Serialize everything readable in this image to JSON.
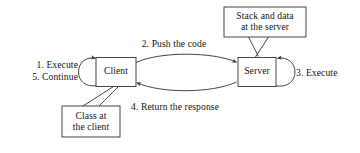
{
  "diagram": {
    "background_color": "#ffffff",
    "stroke_color": "#3b3b3b",
    "text_color": "#161616",
    "nodes": [
      {
        "id": "client",
        "label": "Client"
      },
      {
        "id": "server",
        "label": "Server"
      }
    ],
    "callouts": [
      {
        "id": "callout-server",
        "line1": "Stack and data",
        "line2": "at the server",
        "points_to": "server"
      },
      {
        "id": "callout-client",
        "line1": "Class at",
        "line2": "the client",
        "points_to": "client"
      }
    ],
    "steps": [
      {
        "number": "1.",
        "label": "1. Execute",
        "position": "left-of-client",
        "arrow": "client-self-loop"
      },
      {
        "number": "2.",
        "label": "2. Push the code",
        "position": "above-middle",
        "arrow": "client-to-server"
      },
      {
        "number": "3.",
        "label": "3. Execute",
        "position": "right-of-server",
        "arrow": "server-self-loop"
      },
      {
        "number": "4.",
        "label": "4. Return the response",
        "position": "below-middle",
        "arrow": "server-to-client"
      },
      {
        "number": "5.",
        "label": "5. Continue",
        "position": "left-of-client",
        "arrow": "client-self-loop"
      }
    ],
    "arrows": [
      {
        "id": "client-to-server",
        "from": "client",
        "to": "server",
        "shape": "curve-upper",
        "label_ref": "2. Push the code"
      },
      {
        "id": "server-to-client",
        "from": "server",
        "to": "client",
        "shape": "curve-lower",
        "label_ref": "4. Return the response"
      },
      {
        "id": "client-self-loop",
        "from": "client",
        "to": "client",
        "shape": "ellipse-left",
        "label_ref": "1. Execute / 5. Continue"
      },
      {
        "id": "server-self-loop",
        "from": "server",
        "to": "server",
        "shape": "ellipse-right",
        "label_ref": "3. Execute"
      }
    ]
  }
}
